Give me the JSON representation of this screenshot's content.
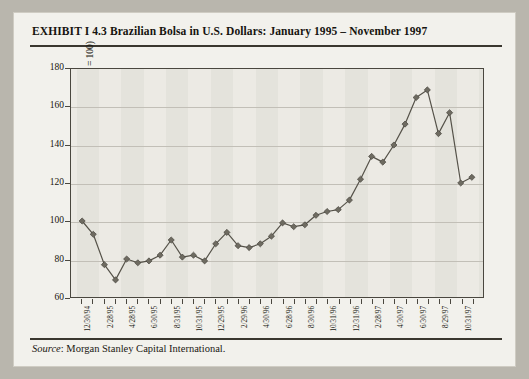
{
  "exhibit": {
    "title": "EXHIBIT I 4.3  Brazilian Bolsa in U.S. Dollars: January 1995 – November 1997",
    "source_label": "Source",
    "source_text": ": Morgan Stanley Capital International."
  },
  "colors": {
    "card_background": "#f2f1ec",
    "page_background": "#b9b6ad",
    "plot_background": "#eceae4",
    "band": "#e2e0d9",
    "gridline": "#c2bfb7",
    "axis": "#4a473f",
    "series_line": "#555249",
    "marker_fill": "#6e6b61",
    "text": "#17150f"
  },
  "chart_data": {
    "type": "line",
    "title": "Brazilian Bolsa in U.S. Dollars: January 1995 – November 1997",
    "xlabel": "",
    "ylabel": "Index value (January 1, 1995 = 100)",
    "ylim": [
      60,
      180
    ],
    "ytick_values": [
      60,
      80,
      100,
      120,
      140,
      160,
      180
    ],
    "ytick_labels": [
      "60",
      "80",
      "100",
      "120",
      "140",
      "160",
      "180"
    ],
    "grid": true,
    "legend": "none",
    "marker": "diamond",
    "xtick_labels": [
      "12/30/94",
      "2/28/95",
      "4/28/95",
      "6/30/95",
      "8/31/95",
      "10/31/95",
      "12/29/95",
      "2/29/96",
      "4/30/96",
      "6/28/96",
      "8/30/96",
      "10/31/96",
      "12/31/96",
      "2/28/97",
      "4/30/97",
      "6/30/97",
      "8/29/97",
      "10/31/97"
    ],
    "xtick_label_interval": 2,
    "x": [
      "12/30/94",
      "1/31/95",
      "2/28/95",
      "3/31/95",
      "4/28/95",
      "5/31/95",
      "6/30/95",
      "7/31/95",
      "8/31/95",
      "9/29/95",
      "10/31/95",
      "11/30/95",
      "12/29/95",
      "1/31/96",
      "2/29/96",
      "3/29/96",
      "4/30/96",
      "5/31/96",
      "6/28/96",
      "7/31/96",
      "8/30/96",
      "9/30/96",
      "10/31/96",
      "11/29/96",
      "12/31/96",
      "1/31/97",
      "2/28/97",
      "3/31/97",
      "4/30/97",
      "5/30/97",
      "6/30/97",
      "7/31/97",
      "8/29/97",
      "9/30/97",
      "10/31/97",
      "11/28/97"
    ],
    "values": [
      100,
      93,
      77,
      69,
      80,
      78,
      79,
      82,
      90,
      81,
      82,
      79,
      88,
      94,
      87,
      86,
      88,
      92,
      99,
      97,
      98,
      103,
      105,
      106,
      111,
      122,
      134,
      131,
      140,
      151,
      165,
      169,
      146,
      157,
      120,
      123
    ],
    "series_name": "Brazilian Bolsa (USD)",
    "start_value": 100,
    "min_value": 69,
    "max_value": 169
  }
}
